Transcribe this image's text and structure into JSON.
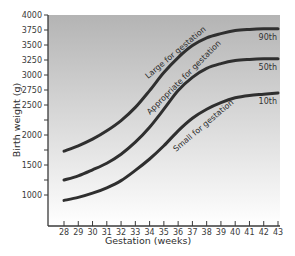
{
  "chart_data": {
    "type": "line",
    "title": "",
    "xlabel": "Gestation (weeks)",
    "ylabel": "Birth weight (g)",
    "x": [
      28,
      29,
      30,
      31,
      32,
      33,
      34,
      35,
      36,
      37,
      38,
      39,
      40,
      41,
      42,
      43
    ],
    "xticks": [
      "28",
      "29",
      "30",
      "31",
      "32",
      "33",
      "34",
      "35",
      "36",
      "37",
      "38",
      "39",
      "40",
      "41",
      "42",
      "43"
    ],
    "yticks": [
      {
        "value": 4000,
        "label": "4000"
      },
      {
        "value": 3750,
        "label": "3750"
      },
      {
        "value": 3500,
        "label": "3500"
      },
      {
        "value": 3250,
        "label": "3250"
      },
      {
        "value": 3000,
        "label": "3000"
      },
      {
        "value": 2750,
        "label": "2750"
      },
      {
        "value": 2500,
        "label": "2500"
      },
      {
        "value": 2250,
        "label": ""
      },
      {
        "value": 2000,
        "label": "2000"
      },
      {
        "value": 1750,
        "label": ""
      },
      {
        "value": 1500,
        "label": "1500"
      },
      {
        "value": 1250,
        "label": ""
      },
      {
        "value": 1000,
        "label": "1000"
      }
    ],
    "ylim": [
      480,
      4000
    ],
    "xlim": [
      27,
      43
    ],
    "grid": false,
    "legend": "inline labels at right end of curves",
    "series": [
      {
        "name": "90th",
        "values": [
          1730,
          1820,
          1930,
          2070,
          2240,
          2460,
          2740,
          3040,
          3290,
          3490,
          3620,
          3690,
          3740,
          3760,
          3770,
          3770
        ]
      },
      {
        "name": "50th",
        "values": [
          1250,
          1320,
          1420,
          1530,
          1680,
          1880,
          2130,
          2430,
          2740,
          2960,
          3110,
          3190,
          3240,
          3260,
          3270,
          3270
        ]
      },
      {
        "name": "10th",
        "values": [
          910,
          960,
          1030,
          1120,
          1240,
          1410,
          1600,
          1820,
          2070,
          2280,
          2430,
          2540,
          2620,
          2660,
          2680,
          2700
        ]
      }
    ],
    "annotations": [
      {
        "text": "Large for gestation",
        "near": "above 90th curve"
      },
      {
        "text": "Appropriate for gestation",
        "near": "between 90th and 50th curves"
      },
      {
        "text": "Small for gestation",
        "near": "below 10th curve"
      }
    ],
    "background": "vertical gradient, grey at top to white at bottom"
  },
  "labels": {
    "xlabel": "Gestation (weeks)",
    "ylabel": "Birth weight (g)",
    "curve_90": "90th",
    "curve_50": "50th",
    "curve_10": "10th",
    "zone_large": "Large for gestation",
    "zone_appropriate": "Appropriate for gestation",
    "zone_small": "Small for gestation"
  },
  "colors": {
    "gradient_top": "#b4b4b4",
    "gradient_bottom": "#ffffff",
    "curve": "#2f2f2f",
    "axis": "#3a3a3a"
  }
}
